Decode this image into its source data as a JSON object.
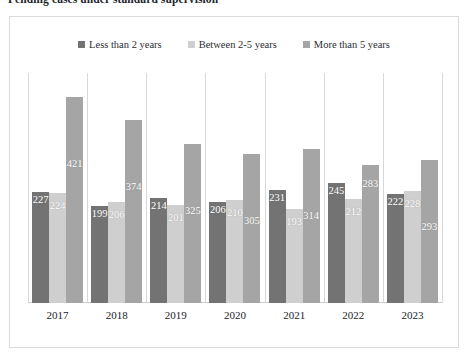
{
  "document": {
    "title": "Pending cases under standard supervision"
  },
  "chart_data": {
    "type": "bar",
    "title": "Pending cases under standard supervision",
    "xlabel": "",
    "ylabel": "",
    "ylim": [
      0,
      470
    ],
    "grid": "vertical-category-separators",
    "legend_position": "top-center",
    "categories": [
      "2017",
      "2018",
      "2019",
      "2020",
      "2021",
      "2022",
      "2023"
    ],
    "series": [
      {
        "name": "Less than 2 years",
        "color": "#737373",
        "values": [
          227,
          199,
          214,
          206,
          231,
          245,
          222
        ]
      },
      {
        "name": "Between 2-5 years",
        "color": "#cfcfcf",
        "values": [
          224,
          206,
          201,
          210,
          193,
          212,
          228
        ]
      },
      {
        "name": "More than 5 years",
        "color": "#a5a5a5",
        "values": [
          421,
          374,
          325,
          305,
          314,
          283,
          293
        ]
      }
    ]
  },
  "legend": {
    "items": [
      {
        "label": "Less than 2 years",
        "swatch": "legend-swatch-series-1"
      },
      {
        "label": "Between 2-5 years",
        "swatch": "legend-swatch-series-2"
      },
      {
        "label": "More than 5 years",
        "swatch": "legend-swatch-series-3"
      }
    ]
  }
}
